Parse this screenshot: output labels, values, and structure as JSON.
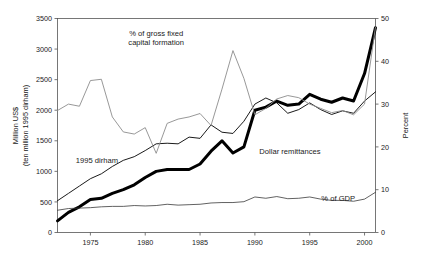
{
  "chart_data": {
    "type": "line",
    "title": "",
    "xlabel": "",
    "ylabel": "Million US$\n(ten million 1995 dirham)",
    "ylabel_line1": "Million US$",
    "ylabel_line2": "(ten million 1995 dirham)",
    "y2label": "Percent",
    "xlim": [
      1972,
      2001
    ],
    "ylim": [
      0,
      3500
    ],
    "y2lim": [
      0,
      50
    ],
    "grid": false,
    "legend_position": "inline-annotations",
    "x": [
      1972,
      1973,
      1974,
      1975,
      1976,
      1977,
      1978,
      1979,
      1980,
      1981,
      1982,
      1983,
      1984,
      1985,
      1986,
      1987,
      1988,
      1989,
      1990,
      1991,
      1992,
      1993,
      1994,
      1995,
      1996,
      1997,
      1998,
      1999,
      2000,
      2001
    ],
    "xticks": [
      1975,
      1980,
      1985,
      1990,
      1995,
      2000
    ],
    "xtick_labels": [
      "1975",
      "1980",
      "1985",
      "1990",
      "1995",
      "2000"
    ],
    "yticks": [
      0,
      500,
      1000,
      1500,
      2000,
      2500,
      3000,
      3500
    ],
    "ytick_labels": [
      "0",
      "500",
      "1000",
      "1500",
      "2000",
      "2500",
      "3000",
      "3500"
    ],
    "y2ticks": [
      0,
      10,
      20,
      30,
      40,
      50
    ],
    "y2tick_labels": [
      "0",
      "10",
      "20",
      "30",
      "40",
      "50"
    ],
    "series": [
      {
        "name": "Dollar remittances",
        "axis": "left",
        "units": "Million US$",
        "color": "#000000",
        "width": 3.0,
        "label": "Dollar remittances",
        "label_x": 1993.2,
        "label_y": 1290,
        "values": [
          190,
          330,
          420,
          540,
          560,
          640,
          700,
          780,
          900,
          1000,
          1030,
          1030,
          1030,
          1120,
          1330,
          1500,
          1300,
          1400,
          2000,
          2050,
          2150,
          2080,
          2100,
          2260,
          2180,
          2130,
          2200,
          2150,
          2600,
          3350
        ]
      },
      {
        "name": "1995 dirham",
        "axis": "left",
        "units": "ten million 1995 dirham",
        "color": "#000000",
        "width": 0.9,
        "label": "1995 dirham",
        "label_x": 1975.6,
        "label_y": 1130,
        "values": [
          520,
          640,
          760,
          880,
          960,
          1080,
          1180,
          1240,
          1340,
          1450,
          1460,
          1450,
          1560,
          1540,
          1760,
          1640,
          1620,
          1820,
          2100,
          2200,
          2120,
          1950,
          2010,
          2120,
          2010,
          1930,
          1990,
          1950,
          2150,
          2300
        ]
      },
      {
        "name": "% of gross fixed capital formation",
        "axis": "right",
        "units": "Percent",
        "color": "#8c8c8c",
        "width": 0.9,
        "label_line1": "% of gross fixed",
        "label_line2": "capital formation",
        "label_x": 1981.0,
        "label_y": 46.0,
        "values": [
          28.5,
          30.0,
          29.5,
          35.5,
          35.8,
          27.0,
          23.5,
          23.0,
          24.5,
          18.5,
          25.5,
          26.5,
          27.0,
          27.8,
          25.0,
          33.5,
          42.5,
          36.0,
          27.5,
          29.0,
          31.2,
          32.0,
          31.5,
          30.0,
          29.0,
          28.0,
          28.5,
          27.5,
          30.0,
          48.0
        ]
      },
      {
        "name": "% of GDP",
        "axis": "right",
        "units": "Percent",
        "color": "#3a3a3a",
        "width": 0.8,
        "label": "% of GDP",
        "label_x": 1997.6,
        "label_y": 7.4,
        "values": [
          5.2,
          5.6,
          5.7,
          5.8,
          6.0,
          6.1,
          6.1,
          6.3,
          6.2,
          6.3,
          6.6,
          6.4,
          6.5,
          6.6,
          6.9,
          7.0,
          7.0,
          7.2,
          8.3,
          8.0,
          8.4,
          7.9,
          8.0,
          8.3,
          7.8,
          7.5,
          7.5,
          7.3,
          7.8,
          9.4
        ]
      }
    ]
  }
}
